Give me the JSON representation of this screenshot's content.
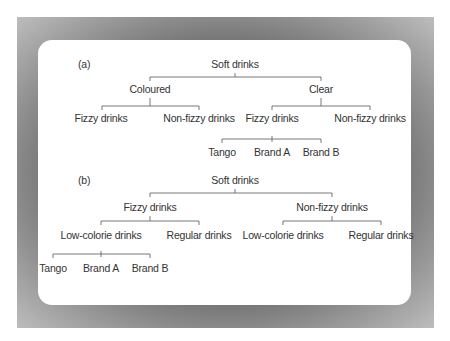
{
  "figure": {
    "a": {
      "label": "(a)",
      "root": "Soft drinks",
      "level1": [
        "Coloured",
        "Clear"
      ],
      "level2": [
        "Fizzy drinks",
        "Non-fizzy drinks",
        "Fizzy drinks",
        "Non-fizzy drinks"
      ],
      "level3": [
        "Tango",
        "Brand A",
        "Brand B"
      ]
    },
    "b": {
      "label": "(b)",
      "root": "Soft drinks",
      "level1": [
        "Fizzy drinks",
        "Non-fizzy drinks"
      ],
      "level2": [
        "Low-colorie drinks",
        "Regular drinks",
        "Low-colorie drinks",
        "Regular drinks"
      ],
      "level3": [
        "Tango",
        "Brand A",
        "Brand B"
      ]
    }
  },
  "colors": {
    "frame": "#6e6e6e",
    "card": "#ffffff",
    "text": "#333333",
    "line": "#555555"
  }
}
